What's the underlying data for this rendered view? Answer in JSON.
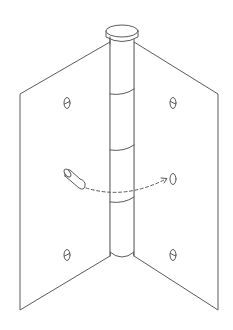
{
  "diagram": {
    "line_color": "#5a5a5a",
    "background_color": "#ffffff",
    "barrel": {
      "x_left": 110,
      "x_right": 134,
      "top_y": 31,
      "bottom_y": 257,
      "cap": {
        "cx": 122,
        "cy": 31,
        "rx": 12,
        "ry": 5
      },
      "knuckle_lines_y": [
        92,
        148,
        200
      ]
    },
    "left_leaf": {
      "points": [
        [
          110,
          42
        ],
        [
          20,
          94
        ],
        [
          20,
          310
        ],
        [
          110,
          256
        ]
      ],
      "screw_holes": [
        [
          67,
          103
        ],
        [
          67,
          255
        ]
      ]
    },
    "right_leaf": {
      "points": [
        [
          134,
          42
        ],
        [
          218,
          94
        ],
        [
          218,
          310
        ],
        [
          134,
          256
        ]
      ],
      "screw_holes": [
        [
          173,
          103
        ],
        [
          173,
          255
        ],
        [
          173,
          178
        ]
      ]
    },
    "pin": {
      "start": [
        67,
        174
      ],
      "end": [
        82,
        190
      ]
    },
    "arrow": {
      "style": "dashed",
      "from": [
        86,
        188
      ],
      "to": [
        168,
        179
      ]
    },
    "caption": ""
  }
}
